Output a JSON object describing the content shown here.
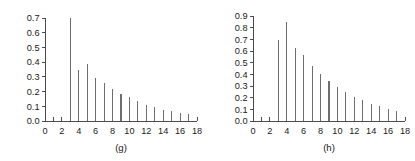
{
  "figure": {
    "background_color": "#ffffff",
    "axis_color": "#4d4d4d",
    "stem_color": "#6e6e6e",
    "text_color": "#1a1a1a"
  },
  "chart_data": [
    {
      "type": "bar",
      "title": "",
      "caption": "(g)",
      "xlabel": "",
      "ylabel": "",
      "xlim": [
        0,
        18
      ],
      "ylim": [
        0.0,
        0.7
      ],
      "grid": false,
      "legend": null,
      "x_major_ticks": [
        0,
        2,
        4,
        6,
        8,
        10,
        12,
        14,
        16,
        18
      ],
      "x_minor_ticks": [
        1,
        3,
        5,
        7,
        9,
        11,
        13,
        15,
        17
      ],
      "x_tick_labels": [
        "0",
        "2",
        "4",
        "6",
        "8",
        "10",
        "12",
        "14",
        "16",
        "18"
      ],
      "y_ticks": [
        0.0,
        0.1,
        0.2,
        0.3,
        0.4,
        0.5,
        0.6,
        0.7
      ],
      "y_tick_labels": [
        "0.0",
        "0.1",
        "0.2",
        "0.3",
        "0.4",
        "0.5",
        "0.6",
        "0.7"
      ],
      "x": [
        3,
        4,
        5,
        6,
        7,
        8,
        9,
        10,
        11,
        12,
        13,
        14,
        15,
        16,
        17
      ],
      "values": [
        0.7,
        0.345,
        0.385,
        0.295,
        0.26,
        0.215,
        0.185,
        0.16,
        0.135,
        0.11,
        0.095,
        0.075,
        0.065,
        0.055,
        0.045
      ],
      "categories": [
        "3",
        "4",
        "5",
        "6",
        "7",
        "8",
        "9",
        "10",
        "11",
        "12",
        "13",
        "14",
        "15",
        "16",
        "17"
      ]
    },
    {
      "type": "bar",
      "title": "",
      "caption": "(h)",
      "xlabel": "",
      "ylabel": "",
      "xlim": [
        0,
        18
      ],
      "ylim": [
        0.0,
        0.9
      ],
      "grid": false,
      "legend": null,
      "x_major_ticks": [
        0,
        2,
        4,
        6,
        8,
        10,
        12,
        14,
        16,
        18
      ],
      "x_minor_ticks": [
        1,
        3,
        5,
        7,
        9,
        11,
        13,
        15,
        17
      ],
      "x_tick_labels": [
        "0",
        "2",
        "4",
        "6",
        "8",
        "10",
        "12",
        "14",
        "16",
        "18"
      ],
      "y_ticks": [
        0.0,
        0.1,
        0.2,
        0.3,
        0.4,
        0.5,
        0.6,
        0.7,
        0.8,
        0.9
      ],
      "y_tick_labels": [
        "0.0",
        "0.1",
        "0.2",
        "0.3",
        "0.4",
        "0.5",
        "0.6",
        "0.7",
        "0.8",
        "0.9"
      ],
      "x": [
        3,
        4,
        5,
        6,
        7,
        8,
        9,
        10,
        11,
        12,
        13,
        14,
        15,
        16,
        17
      ],
      "values": [
        0.695,
        0.845,
        0.63,
        0.565,
        0.47,
        0.4,
        0.345,
        0.295,
        0.25,
        0.205,
        0.18,
        0.15,
        0.125,
        0.105,
        0.09
      ],
      "categories": [
        "3",
        "4",
        "5",
        "6",
        "7",
        "8",
        "9",
        "10",
        "11",
        "12",
        "13",
        "14",
        "15",
        "16",
        "17"
      ]
    }
  ]
}
